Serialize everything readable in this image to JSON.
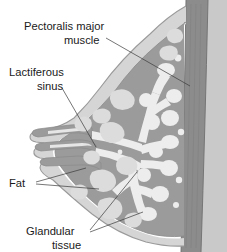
{
  "figure": {
    "type": "anatomical-illustration",
    "background_color": "#ffffff",
    "palette": {
      "skin_outline": "#b9b9b9",
      "subcutaneous_light": "#d5d5d5",
      "stroma_gray": "#9b9b9b",
      "fat_lobule": "#dcdcdc",
      "glandular_white": "#ededed",
      "muscle_dark": "#8c8c8c",
      "chest_wall_mid": "#a6a6a6",
      "leader_line": "#3b3b3b",
      "text": "#1a1a1a"
    }
  },
  "labels": [
    {
      "id": "pectoralis-major-muscle",
      "line1": "Pectoralis major",
      "line2": "muscle",
      "anchor_x": 190,
      "anchor_y": 86
    },
    {
      "id": "lactiferous-sinus",
      "line1": "Lactiferous",
      "line2": "sinus",
      "anchor_x": 96,
      "anchor_y": 147
    },
    {
      "id": "fat",
      "line1": "Fat",
      "line2": "",
      "anchor_x": 99,
      "anchor_y": 188
    },
    {
      "id": "glandular-tissue",
      "line1": "Glandular",
      "line2": "tissue",
      "anchor_x": 137,
      "anchor_y": 194
    }
  ],
  "structures": [
    {
      "id": "skin-envelope",
      "name": "Skin and subcutaneous envelope"
    },
    {
      "id": "pectoralis-major-band",
      "name": "Pectoralis major muscle band"
    },
    {
      "id": "chest-wall",
      "name": "Chest wall"
    },
    {
      "id": "nipple",
      "name": "Nipple"
    },
    {
      "id": "lactiferous-sinuses",
      "name": "Lactiferous sinuses"
    },
    {
      "id": "duct-tree",
      "name": "Branching lactiferous duct tree"
    },
    {
      "id": "glandular-lobules",
      "name": "Glandular tissue lobules"
    },
    {
      "id": "fat-lobules",
      "name": "Adipose (fat) lobules"
    }
  ]
}
